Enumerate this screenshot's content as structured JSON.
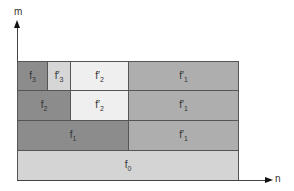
{
  "axes": {
    "y_label": "m",
    "x_label": "n"
  },
  "colors": {
    "dark": "#8c8c8c",
    "medium": "#aeaeae",
    "light": "#d4d4d4",
    "lightest": "#efefef",
    "border": "#555555"
  },
  "blocks": [
    {
      "id": "f3",
      "base": "f",
      "sub": "3",
      "row": 3
    },
    {
      "id": "f3p",
      "base": "f′",
      "sub": "3",
      "row": 3
    },
    {
      "id": "f2p_top",
      "base": "f′",
      "sub": "2",
      "row": 3
    },
    {
      "id": "f1p_top",
      "base": "f′",
      "sub": "1",
      "row": 3
    },
    {
      "id": "f2",
      "base": "f",
      "sub": "2",
      "row": 2
    },
    {
      "id": "f2p_mid",
      "base": "f′",
      "sub": "2",
      "row": 2
    },
    {
      "id": "f1p_mid",
      "base": "f′",
      "sub": "1",
      "row": 2
    },
    {
      "id": "f1",
      "base": "f",
      "sub": "1",
      "row": 1
    },
    {
      "id": "f1p_low",
      "base": "f′",
      "sub": "1",
      "row": 1
    },
    {
      "id": "f0",
      "base": "f",
      "sub": "0",
      "row": 0
    }
  ]
}
